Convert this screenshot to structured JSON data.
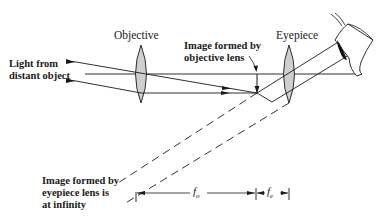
{
  "diagram": {
    "type": "optics ray diagram — astronomical refracting telescope",
    "labels": {
      "objective": "Objective",
      "eyepiece": "Eyepiece",
      "light_source_line1": "Light from",
      "light_source_line2": "distant object",
      "objective_image_line1": "Image formed by",
      "objective_image_line2": "objective lens",
      "eyepiece_image_line1": "Image formed by",
      "eyepiece_image_line2": "eyepiece lens is",
      "eyepiece_image_line3": "at infinity",
      "focal_objective": "f",
      "focal_objective_sub": "o",
      "focal_eyepiece": "f",
      "focal_eyepiece_sub": "e"
    },
    "elements": [
      "objective-lens",
      "eyepiece-lens",
      "optical-axis",
      "incoming-rays",
      "intermediate-image-arrow",
      "outgoing-parallel-rays",
      "virtual-ray-extensions-dashed",
      "observer-eye",
      "focal-length-dimension-fo",
      "focal-length-dimension-fe"
    ],
    "colors": {
      "line": "#1a1a1a",
      "lens_fill": "#cfcfcf",
      "background": "#ffffff"
    }
  }
}
